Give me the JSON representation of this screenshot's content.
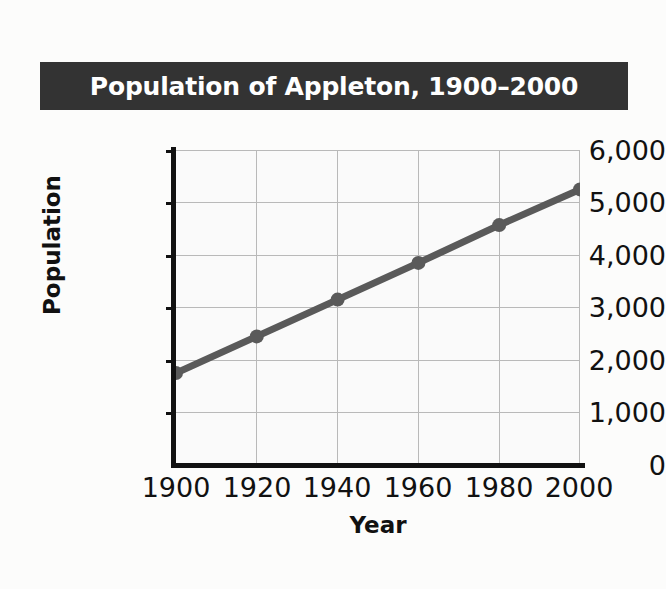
{
  "figure": {
    "background_color": "#fcfcfb",
    "title_banner_color": "#333333",
    "title_text_color": "#ffffff"
  },
  "title": "Population of Appleton, 1900–2000",
  "axis_titles": {
    "x": "Year",
    "y": "Population"
  },
  "chart_data": {
    "type": "line",
    "title": "Population of Appleton, 1900–2000",
    "xlabel": "Year",
    "ylabel": "Population",
    "x": [
      1900,
      1920,
      1940,
      1960,
      1980,
      2000
    ],
    "values": [
      1750,
      2450,
      3150,
      3850,
      4570,
      5250
    ],
    "series": [
      {
        "name": "Population",
        "values": [
          1750,
          2450,
          3150,
          3850,
          4570,
          5250
        ]
      }
    ],
    "xlim": [
      1900,
      2000
    ],
    "ylim": [
      0,
      6000
    ],
    "x_tick_labels": [
      "1900",
      "1920",
      "1940",
      "1960",
      "1980",
      "2000"
    ],
    "y_tick_labels": [
      "0",
      "1,000",
      "2,000",
      "3,000",
      "4,000",
      "5,000",
      "6,000"
    ],
    "y_ticks": [
      0,
      1000,
      2000,
      3000,
      4000,
      5000,
      6000
    ],
    "grid": true,
    "legend": "none",
    "line_color": "#5a5a5a",
    "marker_color": "#5a5a5a",
    "marker": "circle",
    "gridline_color": "#b9b9b9",
    "axis_color": "#111111",
    "plot_background": "#fafafa"
  }
}
